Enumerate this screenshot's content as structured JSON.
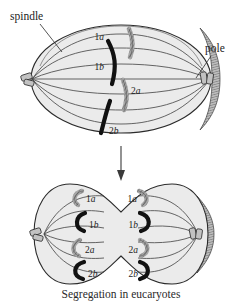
{
  "figure": {
    "caption": "Segregation in eucaryotes",
    "domain_subject": "cell-division-mitosis",
    "colors": {
      "cell_fill": "#ebebeb",
      "cell_outline": "#2b2b2b",
      "cell_rim_shadow": "#b9b9b9",
      "chromosome_dark": "#111111",
      "chromosome_light": "#8d8d8d",
      "spindle_fiber": "#4a4a4a",
      "centriole": "#c2c2c2",
      "background": "#ffffff",
      "text": "#1c1c1c"
    }
  },
  "callouts": {
    "spindle": {
      "label": "spindle"
    },
    "pole": {
      "label": "pole"
    }
  },
  "panels": [
    {
      "id": "metaphase-cell",
      "name": "single-cell-metaphase",
      "chromosomes": [
        {
          "id": "top-1a",
          "num": "1",
          "letter": "a",
          "shade": "light"
        },
        {
          "id": "top-1b",
          "num": "1",
          "letter": "b",
          "shade": "dark"
        },
        {
          "id": "top-2a",
          "num": "2",
          "letter": "a",
          "shade": "light"
        },
        {
          "id": "top-2b",
          "num": "2",
          "letter": "b",
          "shade": "dark"
        }
      ],
      "poles": [
        {
          "id": "pole-left",
          "side": "left"
        },
        {
          "id": "pole-right",
          "side": "right"
        }
      ]
    },
    {
      "id": "telophase-cell",
      "name": "dividing-cell-telophase",
      "daughters": [
        {
          "id": "daughter-left",
          "chromosomes": [
            {
              "id": "dl-1a",
              "num": "1",
              "letter": "a",
              "shade": "light"
            },
            {
              "id": "dl-1b",
              "num": "1",
              "letter": "b",
              "shade": "dark"
            },
            {
              "id": "dl-2a",
              "num": "2",
              "letter": "a",
              "shade": "light"
            },
            {
              "id": "dl-2b",
              "num": "2",
              "letter": "b",
              "shade": "dark"
            }
          ]
        },
        {
          "id": "daughter-right",
          "chromosomes": [
            {
              "id": "dr-1a",
              "num": "1",
              "letter": "a",
              "shade": "light"
            },
            {
              "id": "dr-1b",
              "num": "1",
              "letter": "b",
              "shade": "dark"
            },
            {
              "id": "dr-2a",
              "num": "2",
              "letter": "a",
              "shade": "light"
            },
            {
              "id": "dr-2b",
              "num": "2",
              "letter": "b",
              "shade": "dark"
            }
          ]
        }
      ]
    }
  ],
  "labels": {
    "top_1_num": "1",
    "top_1_a": "a",
    "top_1b_num": "1",
    "top_1b_b": "b",
    "top_2a_num": "2",
    "top_2a_a": "a",
    "top_2b_num": "2",
    "top_2b_b": "b",
    "dl_1a_num": "1",
    "dl_1a_a": "a",
    "dl_1b_num": "1",
    "dl_1b_b": "b",
    "dl_2a_num": "2",
    "dl_2a_a": "a",
    "dl_2b_num": "2",
    "dl_2b_b": "b",
    "dr_1a_num": "1",
    "dr_1a_a": "a",
    "dr_1b_num": "1",
    "dr_1b_b": "b",
    "dr_2a_num": "2",
    "dr_2a_a": "a",
    "dr_2b_num": "2",
    "dr_2b_b": "b"
  },
  "arrow": {
    "name": "process-arrow-down",
    "direction": "down"
  }
}
